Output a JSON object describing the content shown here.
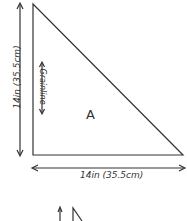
{
  "diagram": {
    "piece_label": "A",
    "width_label": "14in (35.5cm)",
    "height_label": "14in (35.5cm)",
    "grainline_label": "Grainline",
    "stroke_color": "#333333"
  }
}
